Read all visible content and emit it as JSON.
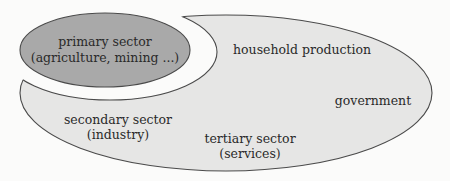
{
  "diagram": {
    "colors": {
      "background": "#fbfbfa",
      "primary_fill": "#a9a9a9",
      "economy_fill": "#e6e6e5",
      "stroke": "#4a4a4a",
      "text": "#2a2a2a"
    },
    "primary_sector": {
      "line1": "primary sector",
      "line2": "(agriculture, mining ...)"
    },
    "household_production": {
      "label": "household production"
    },
    "government": {
      "label": "government"
    },
    "secondary_sector": {
      "line1": "secondary sector",
      "line2": "(industry)"
    },
    "tertiary_sector": {
      "line1": "tertiary sector",
      "line2": "(services)"
    }
  }
}
